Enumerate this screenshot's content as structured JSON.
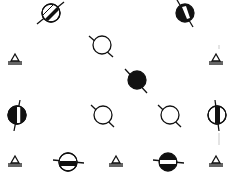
{
  "diagram": {
    "background": "#ffffff",
    "ink": "#111111",
    "symbols": [
      {
        "id": "s1",
        "kind": "circle-diagonal-bar",
        "cx": 51,
        "cy": 13,
        "r": 9,
        "axis_angle": -55,
        "fill": "hatched-black-bar"
      },
      {
        "id": "s2",
        "kind": "circle-black-white-bar",
        "cx": 185,
        "cy": 13,
        "r": 9,
        "axis_angle": 55
      },
      {
        "id": "s3",
        "kind": "triangle",
        "cx": 15,
        "cy": 59
      },
      {
        "id": "s4",
        "kind": "open-circle",
        "cx": 102,
        "cy": 45,
        "r": 9,
        "axis_angle": 35
      },
      {
        "id": "s5",
        "kind": "triangle",
        "cx": 216,
        "cy": 59
      },
      {
        "id": "s6",
        "kind": "black-circle",
        "cx": 137,
        "cy": 80,
        "r": 9,
        "axis_angle": 35
      },
      {
        "id": "s7",
        "kind": "circle-left-black-white-bar",
        "cx": 17,
        "cy": 115,
        "r": 9,
        "axis_angle": 75
      },
      {
        "id": "s8",
        "kind": "open-circle",
        "cx": 103,
        "cy": 115,
        "r": 9,
        "axis_angle": 35
      },
      {
        "id": "s9",
        "kind": "open-circle",
        "cx": 170,
        "cy": 115,
        "r": 9,
        "axis_angle": 35
      },
      {
        "id": "s10",
        "kind": "circle-center-black-bar",
        "cx": 217,
        "cy": 115,
        "r": 9,
        "axis_angle": 80
      },
      {
        "id": "s11",
        "kind": "triangle",
        "cx": 15,
        "cy": 161
      },
      {
        "id": "s12",
        "kind": "circle-horizontal-black-bar",
        "cx": 68,
        "cy": 162,
        "r": 9,
        "axis_angle": 10
      },
      {
        "id": "s13",
        "kind": "triangle",
        "cx": 116,
        "cy": 161
      },
      {
        "id": "s14",
        "kind": "black-circle-white-bar",
        "cx": 168,
        "cy": 162,
        "r": 9,
        "axis_angle": 10
      },
      {
        "id": "s15",
        "kind": "triangle",
        "cx": 216,
        "cy": 161
      }
    ]
  }
}
